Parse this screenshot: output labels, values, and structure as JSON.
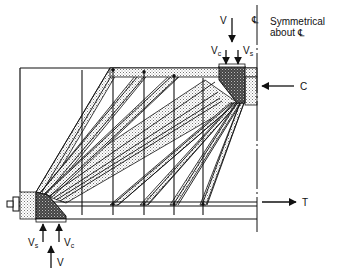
{
  "labels": {
    "top_load": "V",
    "top_vc": "V",
    "top_vc_sub": "c",
    "top_vs": "V",
    "top_vs_sub": "s",
    "centerline_symbol": "℄",
    "symmetry_line1": "Symmetrical",
    "symmetry_line2": "about ℄",
    "compression": "C",
    "tension": "T",
    "bottom_vs": "V",
    "bottom_vs_sub": "s",
    "bottom_vc": "V",
    "bottom_vc_sub": "c",
    "bottom_reaction": "V"
  },
  "elements": {
    "stirrups_count": 5,
    "compression_fan_struts": "fan from bottom-left support node to top chord",
    "compression_fan_top": "fan from top loading node down to bottom chord",
    "top_chord": "C (compression)",
    "bottom_chord": "T (tension)"
  },
  "colors": {
    "line": "#111111",
    "stipple_light": "#cfcfcf",
    "node_dark": "#3a3a3a"
  }
}
